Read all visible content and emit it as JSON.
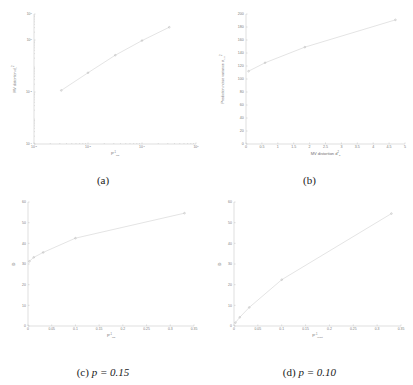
{
  "figure": {
    "panels": [
      {
        "id": "a",
        "caption": "(a)"
      },
      {
        "id": "b",
        "caption": "(b)"
      },
      {
        "id": "c",
        "caption_prefix": "(c)",
        "caption_math": "p = 0.15"
      },
      {
        "id": "d",
        "caption_prefix": "(d)",
        "caption_math": "p = 0.10"
      }
    ]
  },
  "chart_data": [
    {
      "type": "line",
      "panel": "a",
      "title": "",
      "xlabel": "P",
      "xlabel_sup": "-1",
      "xlabel_sub": "ms",
      "ylabel": "MV distortion d",
      "ylabel_sub": "b",
      "ylabel_sup": "2",
      "xscale": "log",
      "yscale": "log",
      "xlim": [
        0.001,
        1
      ],
      "ylim": [
        0.0001,
        10
      ],
      "xticks": [
        0.001,
        0.01,
        0.1,
        1
      ],
      "xticklabels": [
        "10^-3",
        "10^-2",
        "10^-1",
        "10^0"
      ],
      "yticks": [
        0.0001,
        0.01,
        1,
        10
      ],
      "yticklabels": [
        "10^-4",
        "10^-2",
        "10^0",
        "10^1"
      ],
      "grid": false,
      "x": [
        0.0032,
        0.01,
        0.032,
        0.1,
        0.32
      ],
      "y": [
        0.0115,
        0.055,
        0.26,
        0.95,
        3.1
      ],
      "markers": "circle"
    },
    {
      "type": "line",
      "panel": "b",
      "title": "",
      "xlabel": "MV distortion d",
      "xlabel_sub": "b",
      "xlabel_sup": "2",
      "ylabel": "Prediction noise variance σ",
      "ylabel_sub": "p, e",
      "ylabel_sup": "2",
      "xscale": "linear",
      "yscale": "linear",
      "xlim": [
        0,
        5
      ],
      "ylim": [
        0,
        200
      ],
      "xticks": [
        0,
        0.5,
        1,
        1.5,
        2,
        2.5,
        3,
        3.5,
        4,
        4.5,
        5
      ],
      "xticklabels": [
        "0",
        "0.5",
        "1",
        "1.5",
        "2",
        "2.5",
        "3",
        "3.5",
        "4",
        "4.5",
        "5"
      ],
      "yticks": [
        0,
        20,
        40,
        60,
        80,
        100,
        120,
        140,
        160,
        180,
        200
      ],
      "yticklabels": [
        "0",
        "20",
        "40",
        "60",
        "80",
        "100",
        "120",
        "140",
        "160",
        "180",
        "200"
      ],
      "grid": false,
      "x": [
        0.08,
        0.6,
        1.85,
        4.7
      ],
      "y": [
        112,
        125,
        149,
        191
      ],
      "markers": "circle"
    },
    {
      "type": "line",
      "panel": "c",
      "title": "",
      "xlabel": "P",
      "xlabel_sup": "-1",
      "xlabel_sub": "ms",
      "ylabel": "D",
      "xscale": "linear",
      "yscale": "linear",
      "xlim": [
        0,
        0.35
      ],
      "ylim": [
        0,
        60
      ],
      "xticks": [
        0,
        0.05,
        0.1,
        0.15,
        0.2,
        0.25,
        0.3,
        0.35
      ],
      "xticklabels": [
        "0",
        "0.05",
        "0.1",
        "0.15",
        "0.2",
        "0.25",
        "0.3",
        "0.35"
      ],
      "yticks": [
        0,
        10,
        20,
        30,
        40,
        50,
        60
      ],
      "yticklabels": [
        "0",
        "10",
        "20",
        "30",
        "40",
        "50",
        "60"
      ],
      "grid": false,
      "x": [
        0.003,
        0.012,
        0.032,
        0.1,
        0.33
      ],
      "y": [
        31.3,
        33.2,
        35.6,
        42.5,
        54.6
      ],
      "markers": "circle"
    },
    {
      "type": "line",
      "panel": "d",
      "title": "",
      "xlabel": "P",
      "xlabel_sup": "-1",
      "xlabel_sub": "reset",
      "ylabel": "D",
      "xscale": "linear",
      "yscale": "linear",
      "xlim": [
        0,
        0.35
      ],
      "ylim": [
        0,
        60
      ],
      "xticks": [
        0,
        0.05,
        0.1,
        0.15,
        0.2,
        0.25,
        0.3,
        0.35
      ],
      "xticklabels": [
        "0",
        "0.05",
        "0.1",
        "0.15",
        "0.2",
        "0.25",
        "0.3",
        "0.35"
      ],
      "yticks": [
        0,
        10,
        20,
        30,
        40,
        50,
        60
      ],
      "yticklabels": [
        "0",
        "10",
        "20",
        "30",
        "40",
        "50",
        "60"
      ],
      "grid": false,
      "x": [
        0.003,
        0.012,
        0.032,
        0.1,
        0.33
      ],
      "y": [
        1.6,
        4.2,
        9.0,
        22.4,
        54.4
      ],
      "markers": "circle"
    }
  ]
}
